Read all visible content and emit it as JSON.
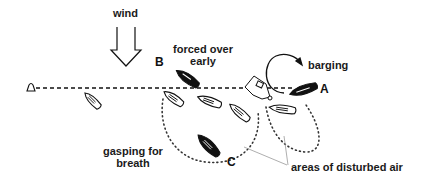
{
  "diagram": {
    "type": "sailing-race-start",
    "colors": {
      "ink": "#111111",
      "dotted": "#333333",
      "pointer_line": "#999999",
      "background": "#ffffff"
    }
  },
  "labels": {
    "wind": "wind",
    "forced_over_line1": "forced over",
    "forced_over_line2": "early",
    "barging": "barging",
    "gasping_line1": "gasping for",
    "gasping_line2": "breath",
    "disturbed_air": "areas of disturbed air"
  },
  "boat_letters": {
    "a": "A",
    "b": "B",
    "c": "C"
  },
  "elements": {
    "wind_arrow": "wind-arrow",
    "start_line": "dashed-start-line",
    "pin_buoy": "buoy-icon",
    "committee_boat": "committee-boat-icon",
    "barging_arrow": "curved-arrow-icon"
  }
}
